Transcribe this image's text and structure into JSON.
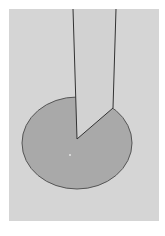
{
  "diagram": {
    "type": "geometric-figure",
    "canvas": {
      "width": 165,
      "height": 236,
      "background": "#ffffff"
    },
    "panel": {
      "x": 9,
      "y": 9,
      "width": 150,
      "height": 212,
      "fill": "#d5d5d5"
    },
    "ellipse": {
      "cx": 77,
      "cy": 143,
      "rx": 55,
      "ry": 46,
      "fill": "#a9a9a9",
      "stroke": "#555555"
    },
    "strip": {
      "fill": "#d2d2d2",
      "stroke": "#333333",
      "points": [
        [
          73,
          9
        ],
        [
          116,
          9
        ],
        [
          113,
          108
        ],
        [
          77,
          139
        ]
      ]
    },
    "center_dot": {
      "x": 70,
      "y": 155,
      "fill": "#e6e6e6"
    }
  }
}
